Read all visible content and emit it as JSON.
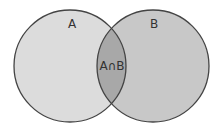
{
  "diagram": {
    "type": "venn",
    "sets": [
      {
        "label": "A",
        "fill": "#dcdcdc"
      },
      {
        "label": "B",
        "fill": "#c8c8c8"
      }
    ],
    "intersection": {
      "label": "A∩B",
      "fill": "#a8a8a8"
    },
    "stroke": "#444444"
  }
}
